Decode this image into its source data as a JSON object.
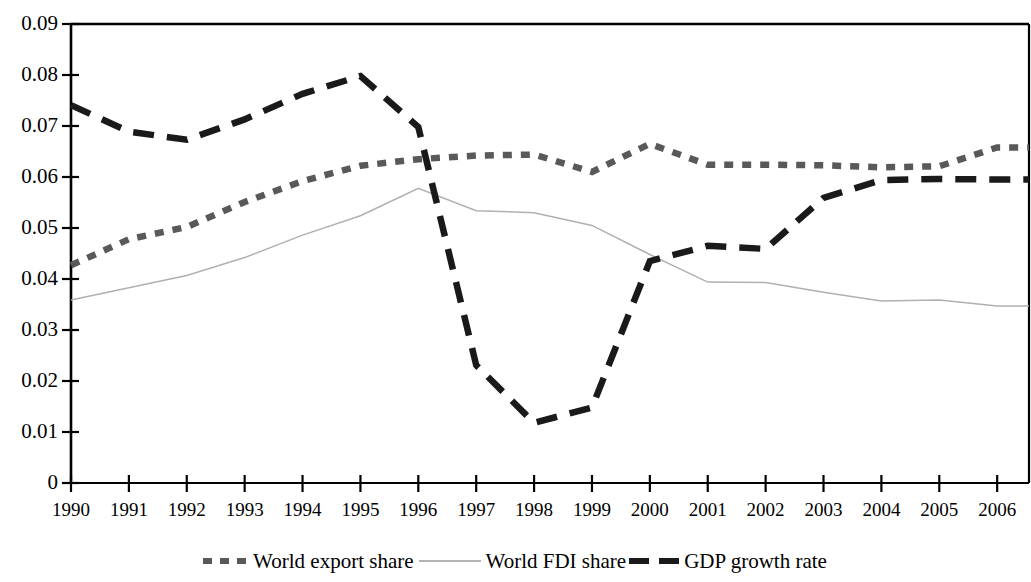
{
  "chart_data": {
    "type": "line",
    "title": "",
    "xlabel": "",
    "ylabel": "",
    "grid": false,
    "legend_position": "bottom",
    "x": [
      1990,
      1991,
      1992,
      1993,
      1994,
      1995,
      1996,
      1997,
      1998,
      1999,
      2000,
      2001,
      2002,
      2003,
      2004,
      2005,
      2006
    ],
    "xtick_labels": [
      "1990",
      "1991",
      "1992",
      "1993",
      "1994",
      "1995",
      "1996",
      "1997",
      "1998",
      "1999",
      "2000",
      "2001",
      "2002",
      "2003",
      "2004",
      "2005",
      "2006"
    ],
    "ytick_labels": [
      "0",
      "0.01",
      "0.02",
      "0.03",
      "0.04",
      "0.05",
      "0.06",
      "0.07",
      "0.08",
      "0.09"
    ],
    "ytick_values": [
      0,
      0.01,
      0.02,
      0.03,
      0.04,
      0.05,
      0.06,
      0.07,
      0.08,
      0.09
    ],
    "xlim": [
      1990,
      2006.55
    ],
    "ylim": [
      0,
      0.09
    ],
    "series": [
      {
        "name": "World export share",
        "style": "dotted",
        "color": "#595959",
        "values": [
          0.0427,
          0.0478,
          0.0502,
          0.0551,
          0.0592,
          0.0622,
          0.0635,
          0.0642,
          0.0644,
          0.061,
          0.0665,
          0.0624,
          0.0624,
          0.0623,
          0.0619,
          0.0621,
          0.0658
        ]
      },
      {
        "name": "World FDI share",
        "style": "solid",
        "color": "#b0b0b0",
        "values": [
          0.0359,
          0.0383,
          0.0407,
          0.0442,
          0.0486,
          0.0524,
          0.0578,
          0.0534,
          0.053,
          0.0505,
          0.0448,
          0.0394,
          0.0393,
          0.0374,
          0.0357,
          0.0359,
          0.0347
        ]
      },
      {
        "name": "GDP growth rate",
        "style": "dashed",
        "color": "#1a1a1a",
        "values": [
          0.0741,
          0.0689,
          0.0673,
          0.0713,
          0.0763,
          0.0798,
          0.0698,
          0.0231,
          0.0118,
          0.0148,
          0.0435,
          0.0465,
          0.0459,
          0.0559,
          0.0594,
          0.0596,
          0.0595
        ]
      }
    ]
  },
  "legend": {
    "items": [
      {
        "label": "World export share"
      },
      {
        "label": "World FDI share"
      },
      {
        "label": "GDP growth rate"
      }
    ]
  },
  "axes": {
    "y_title": "",
    "x_title": ""
  }
}
